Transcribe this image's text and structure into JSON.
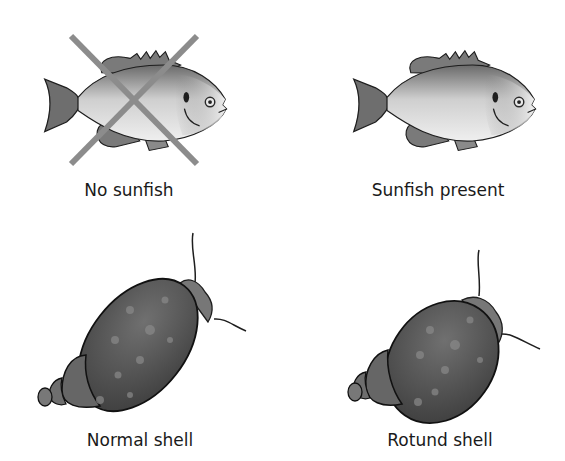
{
  "figure": {
    "panels": [
      {
        "id": "no-sunfish",
        "label": "No sunfish",
        "subject": "sunfish",
        "crossed_out": true
      },
      {
        "id": "sunfish-present",
        "label": "Sunfish present",
        "subject": "sunfish",
        "crossed_out": false
      },
      {
        "id": "normal-shell",
        "label": "Normal shell",
        "subject": "snail",
        "shell_shape": "elongated"
      },
      {
        "id": "rotund-shell",
        "label": "Rotund shell",
        "subject": "snail",
        "shell_shape": "rotund"
      }
    ],
    "colors": {
      "background": "#ffffff",
      "cross_mark": "#8c8c8c",
      "fish_fin": "#6e6e6e",
      "fish_body_light": "#e6e6e6",
      "snail_shell": "#5a5a5a",
      "outline": "#1e1e1e"
    }
  }
}
